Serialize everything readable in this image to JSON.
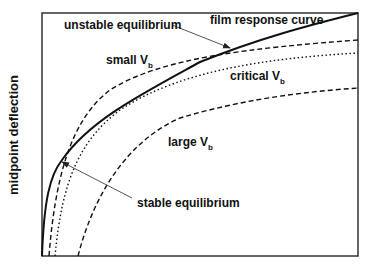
{
  "figure": {
    "y_axis_label": "midpoint deflection",
    "x_axis_label": "",
    "frame": {
      "x0": 42,
      "y0": 13,
      "x1": 358,
      "y1": 256
    },
    "colors": {
      "line": "#111111",
      "arrow": "#666666",
      "frame": "#333333"
    }
  },
  "labels": {
    "unstable": "unstable equilibrium",
    "film": "film response curve",
    "small": "small V",
    "critical": "critical V",
    "large": "large V",
    "stable": "stable equilibrium",
    "subscript": "b"
  },
  "curves": [
    {
      "name": "film response curve",
      "style": "solid",
      "path": "M42,256 C44,200 50,175 62,160 C90,120 140,95 200,62 C260,38 310,25 358,13"
    },
    {
      "name": "small Vb",
      "style": "dashed",
      "path": "M49,256 C55,180 70,120 110,90 C160,58 250,48 358,40"
    },
    {
      "name": "critical Vb",
      "style": "dotted",
      "path": "M55,256 C62,180 80,140 120,110 C180,70 270,58 358,53"
    },
    {
      "name": "large Vb",
      "style": "dashed",
      "path": "M78,256 C95,190 130,140 180,118 C240,100 300,92 358,88"
    }
  ],
  "annotations": [
    {
      "name": "unstable equilibrium",
      "from": [
        172,
        25
      ],
      "to": [
        230,
        48
      ]
    },
    {
      "name": "stable equilibrium",
      "from": [
        132,
        198
      ],
      "to": [
        62,
        162
      ]
    }
  ]
}
